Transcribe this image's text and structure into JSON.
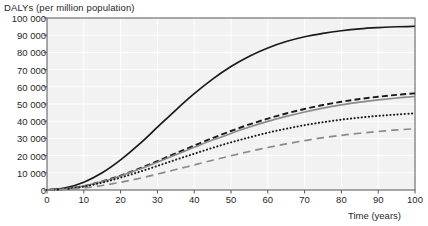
{
  "chart_data": {
    "type": "line",
    "title": "",
    "ylabel": "DALYs (per million population)",
    "xlabel": "Time (years)",
    "xlim": [
      0,
      100
    ],
    "ylim": [
      0,
      100000
    ],
    "grid": true,
    "legend_position": "right-inline",
    "x": [
      0,
      5,
      10,
      15,
      20,
      25,
      30,
      35,
      40,
      45,
      50,
      55,
      60,
      65,
      70,
      75,
      80,
      85,
      90,
      95,
      100
    ],
    "xticks": [
      "0",
      "10",
      "20",
      "30",
      "40",
      "50",
      "60",
      "70",
      "80",
      "90",
      "100"
    ],
    "xtick_values": [
      0,
      10,
      20,
      30,
      40,
      50,
      60,
      70,
      80,
      90,
      100
    ],
    "yticks": [
      "0",
      "10 000",
      "20 000",
      "30 000",
      "40 000",
      "50 000",
      "60 000",
      "70 000",
      "80 000",
      "90 000",
      "100 000"
    ],
    "ytick_values": [
      0,
      10000,
      20000,
      30000,
      40000,
      50000,
      60000,
      70000,
      80000,
      90000,
      100000
    ],
    "series": [
      {
        "name": "England",
        "style": "solid",
        "color": "#1a1a1a",
        "width": 1.7,
        "values": [
          0,
          1200,
          4500,
          10000,
          17500,
          26500,
          36500,
          46500,
          56000,
          64500,
          71800,
          77800,
          82600,
          86300,
          89100,
          91100,
          92600,
          93700,
          94400,
          94900,
          95200
        ]
      },
      {
        "name": "Italy",
        "style": "dashed",
        "color": "#1a1a1a",
        "width": 1.9,
        "values": [
          0,
          700,
          2300,
          5000,
          8400,
          12400,
          16800,
          21300,
          25800,
          30200,
          34300,
          38100,
          41500,
          44500,
          47100,
          49400,
          51300,
          52900,
          54200,
          55300,
          56200
        ]
      },
      {
        "name": "Canada",
        "style": "solid",
        "color": "#8a8a8a",
        "width": 1.6,
        "values": [
          0,
          700,
          2300,
          4900,
          8200,
          12000,
          16200,
          20500,
          24800,
          29000,
          32900,
          36600,
          39900,
          42800,
          45400,
          47600,
          49500,
          51100,
          52400,
          53500,
          54400
        ]
      },
      {
        "name": "Japan",
        "style": "dotted",
        "color": "#1a1a1a",
        "width": 2.0,
        "values": [
          0,
          600,
          2000,
          4300,
          7200,
          10500,
          14000,
          17600,
          21100,
          24500,
          27700,
          30600,
          33300,
          35600,
          37700,
          39400,
          40900,
          42100,
          43100,
          43900,
          44600
        ]
      },
      {
        "name": "Mexico",
        "style": "longdash",
        "color": "#8a8a8a",
        "width": 1.7,
        "values": [
          0,
          350,
          1200,
          2600,
          4500,
          6700,
          9200,
          11900,
          14600,
          17300,
          19900,
          22400,
          24700,
          26800,
          28700,
          30400,
          31800,
          33000,
          34000,
          34900,
          35600
        ]
      }
    ],
    "series_label_positions": [
      {
        "name": "England",
        "y_value": 95200
      },
      {
        "name": "Italy",
        "y_value": 60500
      },
      {
        "name": "Canada",
        "y_value": 53500
      },
      {
        "name": "Japan",
        "y_value": 43500
      },
      {
        "name": "Mexico",
        "y_value": 36200
      }
    ]
  },
  "colors": {
    "plot_background": "#f2f2f2",
    "grid": "#ffffff",
    "frame": "#555555",
    "text": "#1a1a1a"
  }
}
